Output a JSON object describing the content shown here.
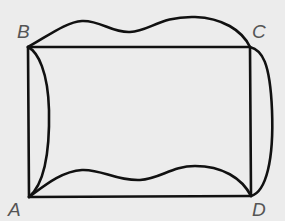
{
  "diagram": {
    "type": "rectangle-with-curved-sides",
    "colors": {
      "background": "#ececec",
      "stroke": "#111111",
      "label": "#555555"
    },
    "vertices": [
      {
        "id": "A",
        "label": "A",
        "x": 29,
        "y": 197
      },
      {
        "id": "B",
        "label": "B",
        "x": 28,
        "y": 47
      },
      {
        "id": "C",
        "label": "C",
        "x": 250,
        "y": 47
      },
      {
        "id": "D",
        "label": "D",
        "x": 251,
        "y": 196
      }
    ],
    "straight_edges": [
      "AB",
      "BC",
      "CD",
      "DA"
    ],
    "curved_edges": [
      {
        "from": "B",
        "to": "C",
        "description": "wavy curve above BC"
      },
      {
        "from": "C",
        "to": "D",
        "description": "curve bulging right of CD"
      },
      {
        "from": "B",
        "to": "A",
        "description": "curve bulging inside, right of AB"
      },
      {
        "from": "A",
        "to": "D",
        "description": "wavy curve above AD"
      }
    ]
  }
}
